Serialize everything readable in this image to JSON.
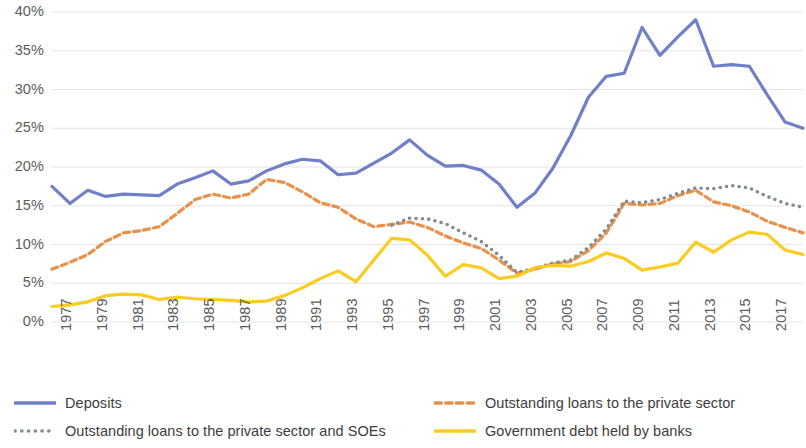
{
  "chart_data": {
    "type": "line",
    "title": "",
    "xlabel": "",
    "ylabel": "",
    "ylim": [
      0,
      40
    ],
    "ytick_labels": [
      "40%",
      "35%",
      "30%",
      "25%",
      "20%",
      "15%",
      "10%",
      "5%",
      "0%"
    ],
    "ytick_values": [
      40,
      35,
      30,
      25,
      20,
      15,
      10,
      5,
      0
    ],
    "grid": true,
    "legend_position": "bottom",
    "x": [
      1977,
      1978,
      1979,
      1980,
      1981,
      1982,
      1983,
      1984,
      1985,
      1986,
      1987,
      1988,
      1989,
      1990,
      1991,
      1992,
      1993,
      1994,
      1995,
      1996,
      1997,
      1998,
      1999,
      2000,
      2001,
      2002,
      2003,
      2004,
      2005,
      2006,
      2007,
      2008,
      2009,
      2010,
      2011,
      2012,
      2013,
      2014,
      2015,
      2016,
      2017,
      2018,
      2019
    ],
    "xtick_labels": [
      "1977",
      "1979",
      "1981",
      "1983",
      "1985",
      "1987",
      "1989",
      "1991",
      "1993",
      "1995",
      "1997",
      "1999",
      "2001",
      "2003",
      "2005",
      "2007",
      "2009",
      "2011",
      "2013",
      "2015",
      "2017",
      "2019"
    ],
    "series": [
      {
        "name": "Deposits",
        "color": "#6f7fc8",
        "style": "solid",
        "values": [
          17.5,
          15.3,
          17.0,
          16.2,
          16.5,
          16.4,
          16.3,
          17.8,
          18.6,
          19.5,
          17.8,
          18.2,
          19.5,
          20.4,
          21.0,
          20.8,
          19.0,
          19.2,
          20.5,
          21.8,
          23.5,
          21.5,
          20.1,
          20.2,
          19.6,
          17.8,
          14.8,
          16.6,
          19.8,
          24.0,
          29.0,
          31.7,
          32.1,
          38.0,
          34.4,
          36.8,
          39.0,
          33.0,
          33.2,
          33.0,
          29.3,
          25.8,
          25.0
        ]
      },
      {
        "name": "Outstanding loans to the private sector",
        "color": "#e8914a",
        "style": "dashed",
        "values": [
          6.8,
          7.7,
          8.7,
          10.4,
          11.5,
          11.8,
          12.3,
          14.0,
          15.8,
          16.5,
          16.0,
          16.5,
          18.4,
          18.0,
          16.8,
          15.4,
          14.8,
          13.3,
          12.3,
          12.6,
          12.9,
          12.2,
          11.1,
          10.2,
          9.5,
          8.0,
          6.3,
          6.8,
          7.5,
          7.8,
          9.2,
          11.5,
          15.3,
          15.1,
          15.3,
          16.3,
          17.0,
          15.5,
          15.0,
          14.2,
          13.0,
          12.2,
          11.5
        ]
      },
      {
        "name": "Outstanding loans to the private sector and SOEs",
        "color": "#808a93",
        "style": "dotted",
        "values": [
          null,
          null,
          null,
          null,
          null,
          null,
          null,
          null,
          null,
          null,
          null,
          null,
          null,
          null,
          null,
          null,
          null,
          null,
          null,
          12.5,
          13.4,
          13.3,
          12.7,
          11.5,
          10.4,
          8.6,
          6.4,
          6.9,
          7.6,
          8.0,
          9.6,
          12.0,
          15.6,
          15.4,
          15.8,
          16.6,
          17.3,
          17.2,
          17.6,
          17.3,
          16.2,
          15.3,
          14.8
        ]
      },
      {
        "name": "Government debt held by banks",
        "color": "#fccb1f",
        "style": "solid",
        "values": [
          2.0,
          2.2,
          2.6,
          3.4,
          3.6,
          3.5,
          2.9,
          3.2,
          3.0,
          2.9,
          2.8,
          2.6,
          2.7,
          3.4,
          4.4,
          5.6,
          6.6,
          5.2,
          8.0,
          10.8,
          10.6,
          8.6,
          5.9,
          7.4,
          7.0,
          5.6,
          5.9,
          7.0,
          7.3,
          7.2,
          7.8,
          8.9,
          8.2,
          6.7,
          7.1,
          7.6,
          10.3,
          9.0,
          10.6,
          11.6,
          11.3,
          9.3,
          8.7
        ]
      }
    ]
  },
  "legend": {
    "items": [
      {
        "label": "Deposits",
        "marker": "solid-blue-line-icon"
      },
      {
        "label": "Outstanding loans to the private sector",
        "marker": "dashed-orange-line-icon"
      },
      {
        "label": "Outstanding loans to the private sector and SOEs",
        "marker": "dotted-gray-line-icon"
      },
      {
        "label": "Government debt held by banks",
        "marker": "solid-yellow-line-icon"
      }
    ]
  },
  "colors": {
    "deposits": "#6f7fc8",
    "private_loans": "#e8914a",
    "private_loans_soe": "#808a93",
    "gov_debt": "#fccb1f",
    "grid": "#e4e4e4",
    "tick_text": "#5c5c5c"
  }
}
